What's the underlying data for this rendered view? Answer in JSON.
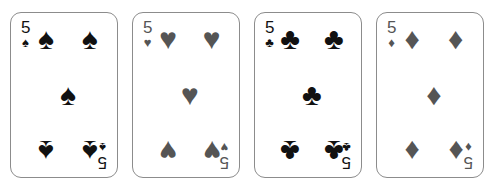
{
  "scene": {
    "title": "Four playing cards of rank five",
    "background_color": "#ffffff",
    "card_face_color": "#ffffff",
    "card_border_color": "#8c8c8c"
  },
  "colors": {
    "black_suit": "#111111",
    "gray_suit": "#555555"
  },
  "cards": [
    {
      "name": "five-of-spades",
      "rank": "5",
      "suit": "spades",
      "pip": "♠",
      "color": "#111111",
      "pip_count": 5
    },
    {
      "name": "five-of-hearts",
      "rank": "5",
      "suit": "hearts",
      "pip": "♥",
      "color": "#555555",
      "pip_count": 5
    },
    {
      "name": "five-of-clubs",
      "rank": "5",
      "suit": "clubs",
      "pip": "♣",
      "color": "#111111",
      "pip_count": 5
    },
    {
      "name": "five-of-diamonds",
      "rank": "5",
      "suit": "diamonds",
      "pip": "♦",
      "color": "#555555",
      "pip_count": 5
    }
  ]
}
